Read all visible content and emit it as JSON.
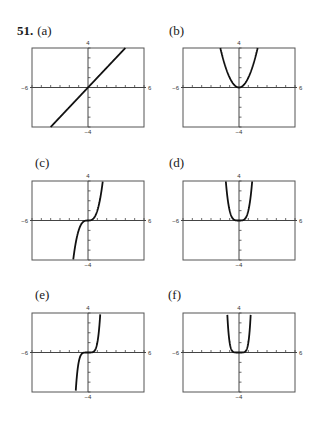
{
  "problem": {
    "number": "51."
  },
  "tick_labels": {
    "xmin": "−6",
    "xmax": "6",
    "ymin": "−4",
    "ymax": "4"
  },
  "chart_data": [
    {
      "type": "line",
      "label": "(a)",
      "function": "y = x",
      "exponent": 1,
      "xlim": [
        -6,
        6
      ],
      "ylim": [
        -4,
        4
      ],
      "xticks": 1,
      "yticks": 1,
      "x_tick_labels": [
        "−6",
        "6"
      ],
      "y_tick_labels": [
        "−4",
        "4"
      ]
    },
    {
      "type": "line",
      "label": "(b)",
      "function": "y = x^2",
      "exponent": 2,
      "xlim": [
        -6,
        6
      ],
      "ylim": [
        -4,
        4
      ],
      "xticks": 1,
      "yticks": 1,
      "x_tick_labels": [
        "−6",
        "6"
      ],
      "y_tick_labels": [
        "−4",
        "4"
      ]
    },
    {
      "type": "line",
      "label": "(c)",
      "function": "y = x^3",
      "exponent": 3,
      "xlim": [
        -6,
        6
      ],
      "ylim": [
        -4,
        4
      ],
      "xticks": 1,
      "yticks": 1,
      "x_tick_labels": [
        "−6",
        "6"
      ],
      "y_tick_labels": [
        "−4",
        "4"
      ]
    },
    {
      "type": "line",
      "label": "(d)",
      "function": "y = x^4",
      "exponent": 4,
      "xlim": [
        -6,
        6
      ],
      "ylim": [
        -4,
        4
      ],
      "xticks": 1,
      "yticks": 1,
      "x_tick_labels": [
        "−6",
        "6"
      ],
      "y_tick_labels": [
        "−4",
        "4"
      ]
    },
    {
      "type": "line",
      "label": "(e)",
      "function": "y = x^5",
      "exponent": 5,
      "xlim": [
        -6,
        6
      ],
      "ylim": [
        -4,
        4
      ],
      "xticks": 1,
      "yticks": 1,
      "x_tick_labels": [
        "−6",
        "6"
      ],
      "y_tick_labels": [
        "−4",
        "4"
      ]
    },
    {
      "type": "line",
      "label": "(f)",
      "function": "y = x^6",
      "exponent": 6,
      "xlim": [
        -6,
        6
      ],
      "ylim": [
        -4,
        4
      ],
      "xticks": 1,
      "yticks": 1,
      "x_tick_labels": [
        "−6",
        "6"
      ],
      "y_tick_labels": [
        "−4",
        "4"
      ]
    }
  ],
  "colors": {
    "curve": "#111111",
    "frame": "#555555",
    "axis": "#444444"
  }
}
